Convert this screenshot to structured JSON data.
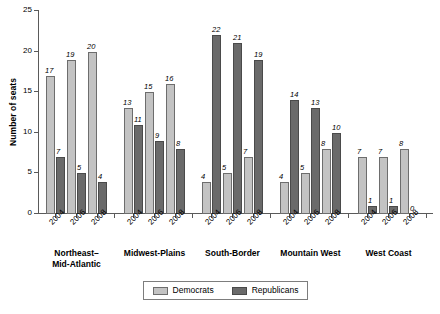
{
  "chart_data": {
    "type": "bar",
    "title": "",
    "xlabel": "",
    "ylabel": "Number of seats",
    "ylim": [
      0,
      25
    ],
    "yticks": [
      0,
      5,
      10,
      15,
      20,
      25
    ],
    "grid": false,
    "legend_position": "bottom",
    "legend": [
      "Democrats",
      "Republicans"
    ],
    "categories": [
      "2004",
      "2006",
      "2008"
    ],
    "groups": [
      {
        "name": "Northeast–\nMid-Atlantic",
        "years": [
          "2004",
          "2006",
          "2008"
        ],
        "series": [
          {
            "name": "Democrats",
            "values": [
              17,
              19,
              20
            ]
          },
          {
            "name": "Republicans",
            "values": [
              7,
              5,
              4
            ]
          }
        ]
      },
      {
        "name": "Midwest-Plains",
        "years": [
          "2004",
          "2006",
          "2008"
        ],
        "series": [
          {
            "name": "Democrats",
            "values": [
              13,
              15,
              16
            ]
          },
          {
            "name": "Republicans",
            "values": [
              11,
              9,
              8
            ]
          }
        ]
      },
      {
        "name": "South-Border",
        "years": [
          "2004",
          "2006",
          "2008"
        ],
        "series": [
          {
            "name": "Democrats",
            "values": [
              4,
              5,
              7
            ]
          },
          {
            "name": "Republicans",
            "values": [
              22,
              21,
              19
            ]
          }
        ]
      },
      {
        "name": "Mountain West",
        "years": [
          "2004",
          "2006",
          "2008"
        ],
        "series": [
          {
            "name": "Democrats",
            "values": [
              4,
              5,
              8
            ]
          },
          {
            "name": "Republicans",
            "values": [
              14,
              13,
              10
            ]
          }
        ]
      },
      {
        "name": "West Coast",
        "years": [
          "2004",
          "2006",
          "2008"
        ],
        "series": [
          {
            "name": "Democrats",
            "values": [
              7,
              7,
              8
            ]
          },
          {
            "name": "Republicans",
            "values": [
              1,
              1,
              0
            ]
          }
        ]
      }
    ],
    "colors": {
      "democrats": "#c3c3c3",
      "republicans": "#6a6a6a",
      "axis": "#5a5a5a",
      "bar_outline": "#6d6d6d",
      "background": "#ffffff"
    }
  },
  "legend": {
    "democrats_label": "Democrats",
    "republicans_label": "Republicans"
  },
  "axis": {
    "y_title": "Number of seats"
  }
}
